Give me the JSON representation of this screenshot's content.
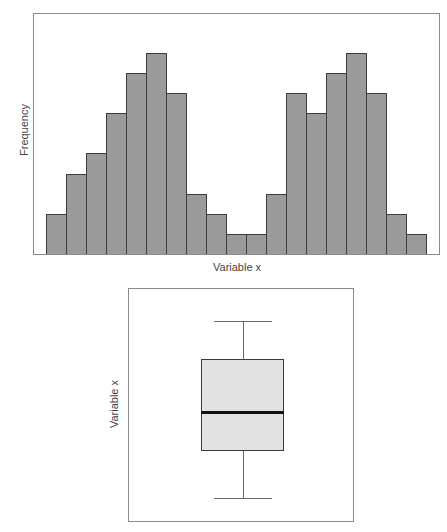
{
  "chart_data": [
    {
      "type": "bar",
      "subtype": "histogram",
      "title": "",
      "xlabel": "Variable x",
      "ylabel": "Frequency",
      "grid": false,
      "legend": null,
      "bins": 19,
      "values": [
        2,
        4,
        5,
        7,
        9,
        10,
        8,
        3,
        2,
        1,
        1,
        3,
        8,
        7,
        9,
        10,
        8,
        2,
        1
      ],
      "ylim": [
        0,
        12
      ],
      "x_ticks": [],
      "y_ticks": [],
      "colors": {
        "bar_fill": "#9b9b9b",
        "bar_edge": "#3c3c3c"
      }
    },
    {
      "type": "box",
      "title": "",
      "xlabel": "",
      "ylabel": "Variable x",
      "grid": false,
      "whisker_low": 0.1,
      "q1": 0.3,
      "median": 0.47,
      "q3": 0.7,
      "whisker_high": 0.86,
      "scale_note": "relative positions (no axis ticks shown)",
      "colors": {
        "box_fill": "#e2e2e2",
        "box_edge": "#3a3a3a",
        "median": "#111111"
      }
    }
  ],
  "labels": {
    "hist_x": "Variable x",
    "hist_y": "Frequency",
    "box_y": "Variable x"
  }
}
